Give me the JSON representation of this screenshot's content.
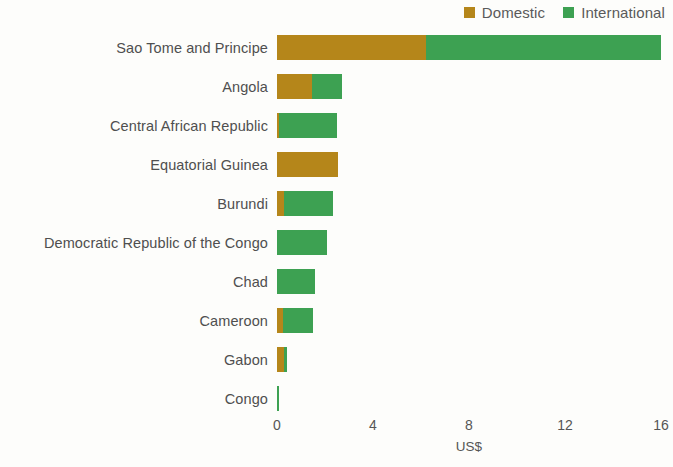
{
  "legend": {
    "position": "top-right",
    "items": [
      {
        "label": "Domestic",
        "color": "#b5861a",
        "icon": "square-swatch-icon"
      },
      {
        "label": "International",
        "color": "#3da152",
        "icon": "square-swatch-icon"
      }
    ]
  },
  "axis": {
    "xlabel": "US$",
    "ticks": [
      "0",
      "4",
      "8",
      "12",
      "16"
    ],
    "tick_values": [
      0,
      4,
      8,
      12,
      16
    ],
    "xlim": [
      0,
      16
    ]
  },
  "chart_data": {
    "type": "bar",
    "orientation": "horizontal",
    "stacked": true,
    "title": "",
    "subtitle": "",
    "xlabel": "US$",
    "ylabel": "",
    "xlim": [
      0,
      16
    ],
    "ylim": null,
    "grid": false,
    "legend_position": "top-right",
    "categories": [
      "Sao Tome and Principe",
      "Angola",
      "Central African Republic",
      "Equatorial Guinea",
      "Burundi",
      "Democratic Republic of the Congo",
      "Chad",
      "Cameroon",
      "Gabon",
      "Congo"
    ],
    "series": [
      {
        "name": "Domestic",
        "color": "#b5861a",
        "values": [
          6.2,
          1.45,
          0.1,
          2.55,
          0.3,
          0.0,
          0.0,
          0.25,
          0.3,
          0.0
        ]
      },
      {
        "name": "International",
        "color": "#3da152",
        "values": [
          9.8,
          1.25,
          2.4,
          0.0,
          2.05,
          2.1,
          1.6,
          1.25,
          0.1,
          0.1
        ]
      }
    ],
    "totals": [
      16.0,
      2.7,
      2.5,
      2.55,
      2.35,
      2.1,
      1.6,
      1.5,
      0.4,
      0.1
    ]
  }
}
